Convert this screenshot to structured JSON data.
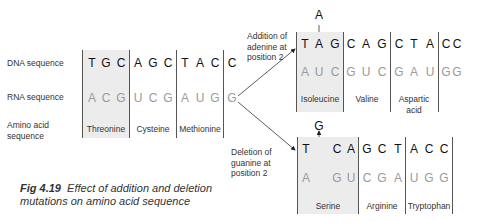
{
  "figure": {
    "caption_number": "Fig 4.19",
    "caption_text": "Effect of addition and deletion",
    "caption_text_line2": "mutations on amino acid sequence"
  },
  "row_labels": {
    "dna": "DNA sequence",
    "rna": "RNA sequence",
    "amino_line1": "Amino acid",
    "amino_line2": "sequence"
  },
  "original": {
    "dna": [
      "T",
      "G",
      "C",
      "A",
      "G",
      "C",
      "T",
      "A",
      "C",
      "C"
    ],
    "rna": [
      "A",
      "C",
      "G",
      "U",
      "C",
      "G",
      "A",
      "U",
      "G",
      "G"
    ],
    "amino_acids": [
      "Threonine",
      "Cysteine",
      "Methionine"
    ]
  },
  "addition": {
    "annotation_line1": "Addition of",
    "annotation_line2": "adenine at",
    "annotation_line3": "position 2",
    "inserted_base": "A",
    "dna": [
      "T",
      "A",
      "G",
      "C",
      "A",
      "G",
      "C",
      "T",
      "A",
      "C",
      "C"
    ],
    "rna": [
      "A",
      "U",
      "C",
      "G",
      "U",
      "C",
      "G",
      "A",
      "U",
      "G",
      "G"
    ],
    "amino_acids": [
      "Isoleucine",
      "Valine",
      "Aspartic acid"
    ],
    "amino_acid_3_line1": "Aspartic",
    "amino_acid_3_line2": "acid"
  },
  "deletion": {
    "annotation_line1": "Deletion of",
    "annotation_line2": "guanine at",
    "annotation_line3": "position 2",
    "removed_base": "G",
    "dna": [
      "T",
      "",
      "C",
      "A",
      "G",
      "C",
      "T",
      "A",
      "C",
      "C"
    ],
    "rna": [
      "A",
      "",
      "G",
      "U",
      "C",
      "G",
      "A",
      "U",
      "G",
      "G"
    ],
    "amino_acids": [
      "Serine",
      "Arginine",
      "Tryptophan"
    ]
  },
  "colors": {
    "dna_text": "#111111",
    "rna_text": "#9a9a9a",
    "shade": "#ececec",
    "lines": "#555555"
  }
}
